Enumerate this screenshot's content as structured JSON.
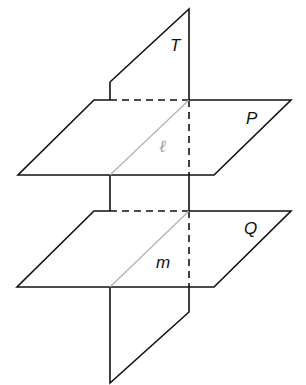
{
  "diagram": {
    "labels": {
      "plane_t": "T",
      "plane_p": "P",
      "plane_q": "Q",
      "line_l": "ℓ",
      "line_m": "m"
    },
    "colors": {
      "stroke": "#111111",
      "intersection_line": "#b0b0b0",
      "background": "#ffffff"
    }
  }
}
